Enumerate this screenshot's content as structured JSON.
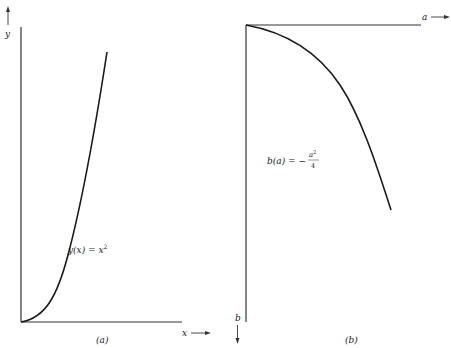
{
  "panel_a": {
    "caption": "(a)",
    "x_axis_label": "x",
    "y_axis_label": "y",
    "curve_label_lhs": "y(x) = x",
    "curve_label_exp": "2"
  },
  "panel_b": {
    "caption": "(b)",
    "a_axis_label": "a",
    "b_axis_label": "b",
    "curve_label_lhs": "b(a) = −",
    "curve_label_num": "a",
    "curve_label_num_exp": "2",
    "curve_label_den": "4"
  },
  "colors": {
    "ink": "#1a1a1a",
    "axis": "#333333",
    "background": "#ffffff"
  }
}
